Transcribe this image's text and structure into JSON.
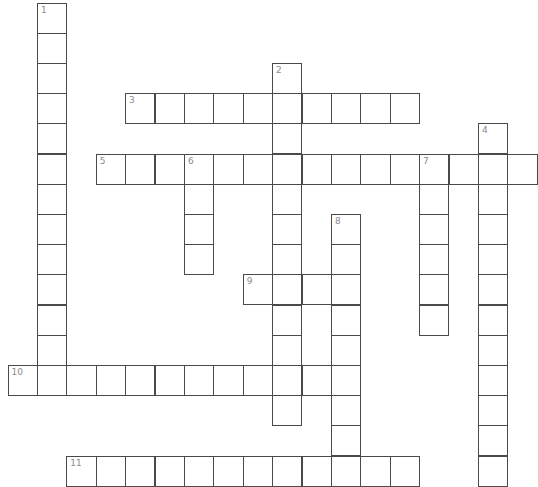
{
  "puzzle": {
    "type": "crossword",
    "layout": {
      "origin_x": 7.5,
      "origin_y": 2.5,
      "cell_w": 29.4,
      "cell_h": 30.2,
      "line_color": "#4a4a4a",
      "number_color": "#8a8a8a"
    },
    "words": [
      {
        "number": "1",
        "direction": "down",
        "row": 0,
        "col": 1,
        "length": 13
      },
      {
        "number": "2",
        "direction": "down",
        "row": 2,
        "col": 9,
        "length": 12
      },
      {
        "number": "3",
        "direction": "across",
        "row": 3,
        "col": 4,
        "length": 10
      },
      {
        "number": "4",
        "direction": "down",
        "row": 4,
        "col": 16,
        "length": 12
      },
      {
        "number": "5",
        "direction": "across",
        "row": 5,
        "col": 3,
        "length": 15
      },
      {
        "number": "6",
        "direction": "down",
        "row": 5,
        "col": 6,
        "length": 4
      },
      {
        "number": "7",
        "direction": "down",
        "row": 5,
        "col": 14,
        "length": 6
      },
      {
        "number": "8",
        "direction": "down",
        "row": 7,
        "col": 11,
        "length": 9
      },
      {
        "number": "9",
        "direction": "across",
        "row": 9,
        "col": 8,
        "length": 4
      },
      {
        "number": "10",
        "direction": "across",
        "row": 12,
        "col": 0,
        "length": 12
      },
      {
        "number": "11",
        "direction": "across",
        "row": 15,
        "col": 2,
        "length": 12
      }
    ]
  }
}
